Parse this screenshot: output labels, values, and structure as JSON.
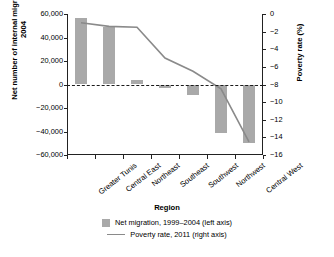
{
  "chart_data": {
    "type": "bar",
    "title": "",
    "xlabel": "Region",
    "ylabel": "Net number of internal migrants, 1999–2004",
    "y2label": "Poverty rate (%)",
    "categories": [
      "Greater Tunis",
      "Central East",
      "Northeast",
      "Southeast",
      "Southwest",
      "Northwest",
      "Central West"
    ],
    "ylim": [
      -60000,
      60000
    ],
    "yticks": [
      60000,
      40000,
      20000,
      0,
      -20000,
      -40000,
      -60000
    ],
    "yticklabels": [
      "60,000",
      "40,000",
      "20,000",
      "0",
      "−20,000",
      "−40,000",
      "−60,000"
    ],
    "y2lim": [
      -16,
      0
    ],
    "y2ticks": [
      0,
      -2,
      -4,
      -6,
      -8,
      -10,
      -12,
      -14,
      -16
    ],
    "y2ticklabels": [
      "0",
      "−2",
      "−4",
      "−6",
      "−8",
      "−10",
      "−12",
      "−14",
      "−16"
    ],
    "grid": false,
    "legend_position": "bottom",
    "series": [
      {
        "name": "Net migration, 1999–2004 (left axis)",
        "type": "bar",
        "axis": "left",
        "color": "#a9a9a9",
        "values": [
          57000,
          49000,
          4000,
          -3000,
          -9000,
          -41000,
          -50000
        ]
      },
      {
        "name": "Poverty rate, 2011 (right axis)",
        "type": "line",
        "axis": "right",
        "color": "#8a8a8a",
        "values": [
          -1.0,
          -1.4,
          -1.5,
          -5.0,
          -6.5,
          -8.5,
          -14.5
        ]
      }
    ]
  },
  "legend": {
    "items": [
      {
        "label": "Net migration, 1999–2004 (left axis)",
        "marker": "bar-swatch"
      },
      {
        "label": "Poverty rate, 2011 (right axis)",
        "marker": "line-swatch"
      }
    ]
  }
}
